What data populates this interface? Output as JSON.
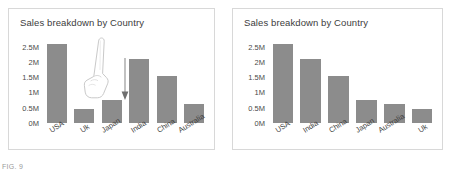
{
  "figure": {
    "caption": "FIG. 9"
  },
  "panels": [
    {
      "name": "before-sort",
      "title": "Sales breakdown by Country",
      "annotation": {
        "hand_icon": "pointing-hand-cursor",
        "arrow_icon": "down-arrow-icon"
      },
      "chart_data": {
        "type": "bar",
        "title": "Sales breakdown by Country",
        "xlabel": "",
        "ylabel": "",
        "categories": [
          "USA",
          "Uk",
          "Japan",
          "India",
          "China",
          "Australia"
        ],
        "values": [
          2600000,
          450000,
          750000,
          2100000,
          1550000,
          620000
        ],
        "ytick_labels": [
          "2.5M",
          "2M",
          "1.5M",
          "1M",
          "0.5M",
          "0M"
        ],
        "ytick_values": [
          2500000,
          2000000,
          1500000,
          1000000,
          500000,
          0
        ],
        "ylim": [
          0,
          2750000
        ],
        "grid": false,
        "legend": "none",
        "bar_color": "#8c8c8c"
      }
    },
    {
      "name": "after-sort",
      "title": "Sales breakdown by Country",
      "chart_data": {
        "type": "bar",
        "title": "Sales breakdown by Country",
        "xlabel": "",
        "ylabel": "",
        "categories": [
          "USA",
          "India",
          "China",
          "Japan",
          "Australia",
          "Uk"
        ],
        "values": [
          2600000,
          2100000,
          1550000,
          750000,
          620000,
          450000
        ],
        "ytick_labels": [
          "2.5M",
          "2M",
          "1.5M",
          "1M",
          "0.5M",
          "0M"
        ],
        "ytick_values": [
          2500000,
          2000000,
          1500000,
          1000000,
          500000,
          0
        ],
        "ylim": [
          0,
          2750000
        ],
        "grid": false,
        "legend": "none",
        "bar_color": "#8c8c8c"
      }
    }
  ]
}
